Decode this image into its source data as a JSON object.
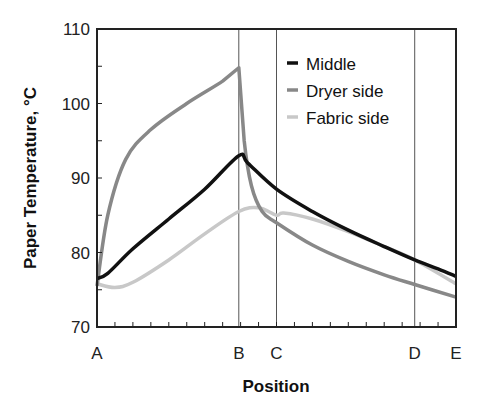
{
  "chart_data": {
    "type": "line",
    "title": "",
    "xlabel": "Position",
    "ylabel": "Paper Temperature, °C",
    "ylim": [
      70,
      110
    ],
    "yticks": [
      70,
      80,
      90,
      100,
      110
    ],
    "x_positions": [
      "A",
      "B",
      "C",
      "D",
      "E"
    ],
    "x_position_fractions": [
      0.0,
      0.395,
      0.5,
      0.885,
      1.0
    ],
    "vertical_lines_at": [
      "B",
      "C",
      "D"
    ],
    "legend": {
      "position": "upper right",
      "entries": [
        "Middle",
        "Dryer side",
        "Fabric side"
      ]
    },
    "series": [
      {
        "name": "Middle",
        "color": "#111111",
        "x": [
          0.0,
          0.03,
          0.1,
          0.2,
          0.3,
          0.395,
          0.42,
          0.5,
          0.6,
          0.7,
          0.8,
          0.885,
          0.95,
          1.0
        ],
        "values": [
          76.5,
          77.2,
          80.5,
          84.5,
          88.5,
          93.0,
          92.0,
          88.5,
          85.5,
          83.0,
          80.8,
          79.0,
          77.8,
          76.8
        ]
      },
      {
        "name": "Dryer side",
        "color": "#888888",
        "x": [
          0.0,
          0.03,
          0.08,
          0.15,
          0.25,
          0.35,
          0.395,
          0.41,
          0.43,
          0.46,
          0.5,
          0.6,
          0.7,
          0.8,
          0.885,
          1.0
        ],
        "values": [
          75.5,
          85.0,
          92.5,
          96.5,
          100.0,
          103.0,
          104.8,
          95.0,
          89.0,
          85.5,
          84.0,
          81.0,
          78.8,
          77.0,
          75.7,
          74.0
        ]
      },
      {
        "name": "Fabric side",
        "color": "#c8c8c8",
        "x": [
          0.0,
          0.05,
          0.1,
          0.2,
          0.3,
          0.395,
          0.45,
          0.5,
          0.52,
          0.6,
          0.7,
          0.8,
          0.885,
          1.0
        ],
        "values": [
          75.8,
          75.3,
          76.0,
          79.0,
          82.5,
          85.5,
          86.0,
          85.0,
          85.3,
          84.5,
          82.8,
          80.8,
          79.0,
          75.8
        ]
      }
    ]
  }
}
